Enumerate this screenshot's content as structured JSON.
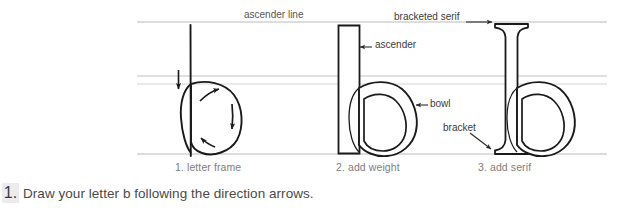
{
  "page": {
    "background_color": "#ffffff",
    "ink_color": "#1a1a1a",
    "guide_color": "#b9b9b9",
    "caption_color": "#7e7e7e",
    "text_color": "#4a4a4a"
  },
  "annotations": {
    "ascender_line": "ascender line",
    "bracketed_serif": "bracketed serif",
    "ascender": "ascender",
    "bowl": "bowl",
    "bracket": "bracket"
  },
  "captions": {
    "step1": "1. letter frame",
    "step2": "2. add weight",
    "step3": "3. add serif"
  },
  "instruction": {
    "marker": "1.",
    "text": "Draw your letter b following the direction arrows."
  },
  "figures": [
    {
      "name": "letter-frame",
      "caption": "1. letter frame",
      "description": "skeleton letter b: vertical stem line with oval bowl and four direction arrows"
    },
    {
      "name": "add-weight",
      "caption": "2. add weight",
      "description": "letter b with thickened rectangular stem and weighted bowl with counter"
    },
    {
      "name": "add-serif",
      "caption": "3. add serif",
      "description": "letter b with flared bracketed serifs on the ascender stem"
    }
  ],
  "guides": {
    "ascender_line_y": 22,
    "upper_x_height_y": 76,
    "lower_x_height_y": 84,
    "baseline_y": 154,
    "left_x": 137,
    "right_x": 607
  }
}
